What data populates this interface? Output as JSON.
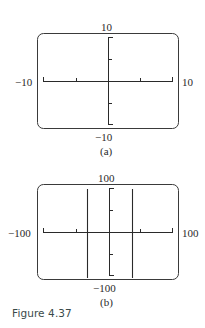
{
  "panels": [
    {
      "id": "a",
      "sublabel": "(a)",
      "window": {
        "xmin": "-10",
        "xmax": "10",
        "ymin": "-10",
        "ymax": "10"
      },
      "labels": {
        "top": "10",
        "bottom": "−10",
        "left": "−10",
        "right": "10"
      },
      "graph_lines": []
    },
    {
      "id": "b",
      "sublabel": "(b)",
      "window": {
        "xmin": "-100",
        "xmax": "100",
        "ymin": "-100",
        "ymax": "100"
      },
      "labels": {
        "top": "100",
        "bottom": "−100",
        "left": "−100",
        "right": "100"
      },
      "graph_lines": [
        {
          "type": "vertical",
          "approx_x": -45
        },
        {
          "type": "vertical",
          "approx_x": 45
        }
      ]
    }
  ],
  "caption": "Figure 4.37",
  "colors": {
    "ink": "#2a2a2a",
    "frame": "#3a3a3a",
    "caption": "#3a4a4a"
  }
}
